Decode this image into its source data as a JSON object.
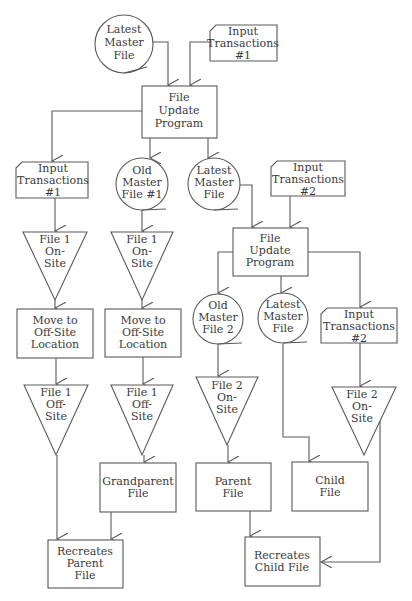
{
  "diagram": {
    "colors": {
      "line": "#5a5a5a",
      "text": "#3a3a3a",
      "background": "#ffffff"
    },
    "top": {
      "latest_master_file": [
        "Latest",
        "Master",
        "File"
      ],
      "input_transactions_1": [
        "Input",
        "Transactions",
        "#1"
      ],
      "file_update_program": [
        "File",
        "Update",
        "Program"
      ]
    },
    "col_a": {
      "input_transactions_1": [
        "Input",
        "Transactions",
        "#1"
      ],
      "file_1_on_site": [
        "File 1",
        "On-",
        "Site"
      ],
      "move_to_offsite": [
        "Move to",
        "Off-Site",
        "Location"
      ],
      "file_1_off_site": [
        "File 1",
        "Off-",
        "Site"
      ],
      "recreates_parent_file": [
        "Recreates",
        "Parent",
        "File"
      ]
    },
    "col_b": {
      "old_master_file_1": [
        "Old",
        "Master",
        "File #1"
      ],
      "file_1_on_site": [
        "File 1",
        "On-",
        "Site"
      ],
      "move_to_offsite": [
        "Move to",
        "Off-Site",
        "Location"
      ],
      "file_1_off_site": [
        "File 1",
        "Off-",
        "Site"
      ],
      "grandparent_file": [
        "Grandparent",
        "File"
      ]
    },
    "col_c": {
      "latest_master_file": [
        "Latest",
        "Master",
        "File"
      ],
      "input_transactions_2": [
        "Input",
        "Transactions",
        "#2"
      ],
      "file_update_program": [
        "File",
        "Update",
        "Program"
      ]
    },
    "sub": {
      "old_master_file_2": [
        "Old",
        "Master",
        "File 2"
      ],
      "file_2_on_site_a": [
        "File 2",
        "On-",
        "Site"
      ],
      "parent_file": [
        "Parent",
        "File"
      ],
      "latest_master_file": [
        "Latest",
        "Master",
        "File"
      ],
      "child_file": [
        "Child",
        "File"
      ],
      "input_transactions_2": [
        "Input",
        "Transactions",
        "#2"
      ],
      "file_2_on_site_b": [
        "File 2",
        "On-",
        "Site"
      ],
      "recreates_child_file": [
        "Recreates",
        "Child File"
      ]
    }
  }
}
